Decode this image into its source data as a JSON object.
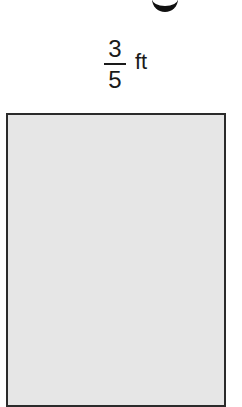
{
  "figure": {
    "title_partial": "g",
    "dimension_label": {
      "numerator": "3",
      "denominator": "5",
      "unit": "ft"
    },
    "shape": {
      "type": "rectangle",
      "fill_color": "#e6e6e6",
      "border_color": "#2b2b2b"
    }
  }
}
